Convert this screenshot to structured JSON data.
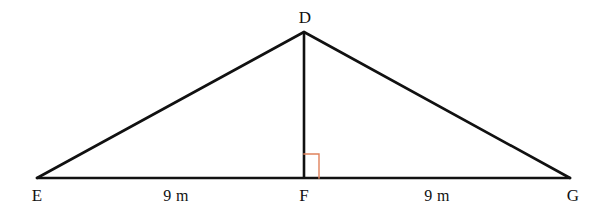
{
  "figure": {
    "kind": "geometry-diagram",
    "shape": "isosceles-triangle-with-altitude",
    "background_color": "#ffffff",
    "stroke_color": "#111111",
    "stroke_width": 2.6,
    "right_angle_color": "#E0825C",
    "right_angle_width": 1.4,
    "canvas": {
      "width": 612,
      "height": 213
    }
  },
  "vertices": {
    "apex": {
      "label": "D",
      "x": 304,
      "y": 32,
      "label_x": 305,
      "label_y": 9
    },
    "left": {
      "label": "E",
      "x": 37,
      "y": 178,
      "label_x": 37,
      "label_y": 187
    },
    "foot": {
      "label": "F",
      "x": 304,
      "y": 178,
      "label_x": 304,
      "label_y": 187
    },
    "right": {
      "label": "G",
      "x": 570,
      "y": 178,
      "label_x": 573,
      "label_y": 187
    }
  },
  "edges": [
    {
      "name": "side-DE",
      "from": "D",
      "to": "E"
    },
    {
      "name": "side-DG",
      "from": "D",
      "to": "G"
    },
    {
      "name": "base-EG",
      "from": "E",
      "to": "G"
    },
    {
      "name": "altitude-DF",
      "from": "D",
      "to": "F"
    }
  ],
  "measurements": [
    {
      "name": "segment-EF",
      "text": "9 m",
      "value": 9,
      "unit": "m",
      "x": 176,
      "y": 188
    },
    {
      "name": "segment-FG",
      "text": "9 m",
      "value": 9,
      "unit": "m",
      "x": 437,
      "y": 188
    }
  ],
  "right_angle": {
    "name": "right-angle-at-F",
    "at_vertex": "F",
    "degrees": 90,
    "x": 304,
    "y": 154,
    "size": 15,
    "color": "#E0825C"
  }
}
